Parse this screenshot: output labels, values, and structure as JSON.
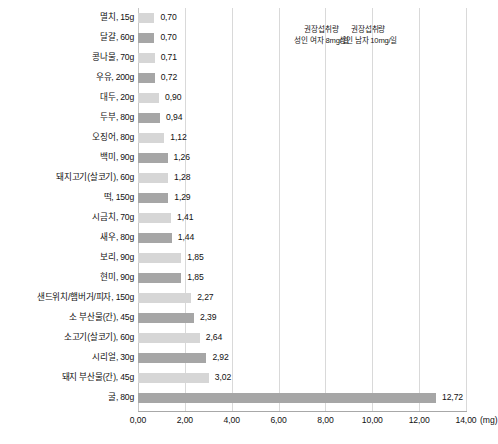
{
  "chart_data": {
    "type": "bar",
    "orientation": "horizontal",
    "title": "",
    "xlabel": "(mg)",
    "ylabel": "",
    "xlim": [
      0,
      14
    ],
    "grid": true,
    "legend": "none",
    "unit_label": "(mg)",
    "xticks": [
      "0,00",
      "2,00",
      "4,00",
      "6,00",
      "8,00",
      "10,00",
      "12,00",
      "14,00"
    ],
    "xtick_values": [
      0,
      2,
      4,
      6,
      8,
      10,
      12,
      14
    ],
    "categories": [
      "멸치, 15g",
      "달걀, 60g",
      "콩나물, 70g",
      "우유, 200g",
      "대두, 20g",
      "두부, 80g",
      "오징어, 80g",
      "백미, 90g",
      "돼지고기(살코기), 60g",
      "떡, 150g",
      "시금치, 70g",
      "새우, 80g",
      "보리, 90g",
      "현미, 90g",
      "샌드위치/햄버거/피자, 150g",
      "소 부산물(간), 45g",
      "소고기(살코기), 60g",
      "시리얼, 30g",
      "돼지 부산물(간), 45g",
      "굴, 80g"
    ],
    "values": [
      0.7,
      0.7,
      0.71,
      0.72,
      0.9,
      0.94,
      1.12,
      1.26,
      1.28,
      1.29,
      1.41,
      1.44,
      1.85,
      1.85,
      2.27,
      2.39,
      2.64,
      2.92,
      3.02,
      12.72
    ],
    "value_labels": [
      "0,70",
      "0,70",
      "0,71",
      "0,72",
      "0,90",
      "0,94",
      "1,12",
      "1,26",
      "1,28",
      "1,29",
      "1,41",
      "1,44",
      "1,85",
      "1,85",
      "2,27",
      "2,39",
      "2,64",
      "2,92",
      "3,02",
      "12,72"
    ],
    "bar_shades": [
      "light",
      "dark",
      "light",
      "dark",
      "light",
      "dark",
      "light",
      "dark",
      "light",
      "dark",
      "light",
      "dark",
      "light",
      "dark",
      "light",
      "dark",
      "light",
      "dark",
      "light",
      "dark"
    ],
    "annotations": [
      {
        "line1": "권장섭취량",
        "line2": "성인 여자 8mg/일",
        "x_value": 8
      },
      {
        "line1": "권장섭취량",
        "line2": "성인 남자 10mg/일",
        "x_value": 10
      }
    ],
    "colors": {
      "bar_light": "#d6d6d6",
      "bar_dark": "#a6a6a6",
      "gridline": "#d9d9d9",
      "axis": "#a8a8a8",
      "text": "#111111",
      "background": "#ffffff"
    }
  }
}
